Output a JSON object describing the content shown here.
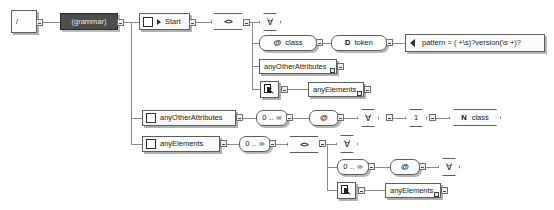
{
  "diagram": {
    "kind": "schema-tree-diagram",
    "colors": {
      "selected_fill": "#4d4d4d",
      "selected_text": "#e8e8e8",
      "node_fill": "#fcfcfc",
      "node_border": "#5d5d5d",
      "connector": "#8a8a8a"
    }
  },
  "nodes": {
    "root": {
      "label": "/",
      "icon": "root-slash-icon"
    },
    "grammar": {
      "label": "(grammar)",
      "icon": "grammar-icon",
      "selected": true
    },
    "start": {
      "label": "Start",
      "icon": "start-element-icon"
    },
    "choice_top": {
      "label": "<>",
      "icon": "element-angle-icon"
    },
    "forall_1": {
      "label": "∀",
      "icon": "forall-icon"
    },
    "attr_class": {
      "label": "class",
      "icon": "at-attribute-icon"
    },
    "data_token": {
      "label": "token",
      "icon": "datatype-icon"
    },
    "pattern_facet": {
      "label": "pattern = ( +\\s)?version(\\s +)?",
      "icon": "facet-arrow-icon"
    },
    "any_other_attrs_ref": {
      "label": "anyOtherAttributes",
      "icon": "ref-box-icon"
    },
    "ref_pointer_1": {
      "label": "",
      "icon": "ref-pointer-icon"
    },
    "any_elements_ref": {
      "label": "anyElements",
      "icon": "ref-box-icon"
    },
    "def_any_other_attrs": {
      "label": "anyOtherAttributes",
      "icon": "define-square-icon"
    },
    "repeat_1": {
      "label": "0 .. ∞",
      "icon": "cardinality-icon"
    },
    "attr_any": {
      "label": "",
      "icon": "at-attribute-icon"
    },
    "forall_2": {
      "label": "∀",
      "icon": "forall-icon"
    },
    "except_1": {
      "label": "1",
      "icon": "one-icon"
    },
    "nsname_class": {
      "label": "class",
      "icon": "nsname-icon"
    },
    "def_any_elements": {
      "label": "anyElements",
      "icon": "define-square-icon"
    },
    "repeat_2": {
      "label": "0 .. ∞",
      "icon": "cardinality-icon"
    },
    "choice_bottom": {
      "label": "<>",
      "icon": "element-angle-icon"
    },
    "forall_3": {
      "label": "∀",
      "icon": "forall-icon"
    },
    "repeat_3": {
      "label": "0 .. ∞",
      "icon": "cardinality-icon"
    },
    "attr_any_2": {
      "label": "",
      "icon": "at-attribute-icon"
    },
    "forall_4": {
      "label": "∀",
      "icon": "forall-icon"
    },
    "ref_pointer_2": {
      "label": "",
      "icon": "ref-pointer-icon"
    },
    "any_elements_ref_2": {
      "label": "anyElements",
      "icon": "ref-box-icon"
    }
  },
  "glyphs": {
    "at": "@",
    "datatype": "D",
    "nsname": "N",
    "angle": "<>",
    "forall": "∀"
  }
}
